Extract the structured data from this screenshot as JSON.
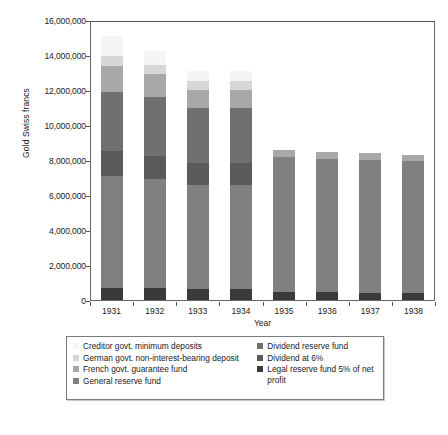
{
  "chart_data": {
    "type": "bar",
    "subtype": "stacked-bar",
    "title": "",
    "xlabel": "Year",
    "ylabel": "Gold Swiss francs",
    "categories": [
      "1931",
      "1932",
      "1933",
      "1934",
      "1935",
      "1936",
      "1937",
      "1938"
    ],
    "ylim": [
      0,
      16000000
    ],
    "ytick_values": [
      0,
      2000000,
      4000000,
      6000000,
      8000000,
      10000000,
      12000000,
      14000000,
      16000000
    ],
    "ytick_labels": [
      "0",
      "2,000,000",
      "4,000,000",
      "6,000,000",
      "8,000,000",
      "10,000,000",
      "12,000,000",
      "14,000,000",
      "16,000,000"
    ],
    "grid": false,
    "legend_position": "below",
    "legend_columns": 2,
    "series": [
      {
        "name": "Legal reserve fund 5% of net profit",
        "color": "#3a3a3a",
        "legend_column": "right",
        "values": [
          700000,
          700000,
          650000,
          650000,
          450000,
          430000,
          420000,
          420000
        ]
      },
      {
        "name": "General reserve fund",
        "color": "#808080",
        "legend_column": "left",
        "values": [
          6400000,
          6200000,
          5900000,
          5900000,
          7700000,
          7650000,
          7600000,
          7500000
        ]
      },
      {
        "name": "Dividend at 6%",
        "color": "#5a5a5a",
        "legend_column": "right",
        "values": [
          1400000,
          1350000,
          1300000,
          1300000,
          0,
          0,
          0,
          0
        ]
      },
      {
        "name": "Dividend reserve fund",
        "color": "#707070",
        "legend_column": "right",
        "values": [
          3400000,
          3350000,
          3150000,
          3150000,
          0,
          0,
          0,
          0
        ]
      },
      {
        "name": "French govt. guarantee fund",
        "color": "#a8a8a8",
        "legend_column": "left",
        "values": [
          1450000,
          1300000,
          1000000,
          1000000,
          450000,
          400000,
          380000,
          380000
        ]
      },
      {
        "name": "German govt. non-interest-bearing deposit",
        "color": "#d6d6d6",
        "legend_column": "left",
        "values": [
          600000,
          550000,
          500000,
          500000,
          0,
          0,
          0,
          0
        ]
      },
      {
        "name": "Creditor govt. minimum deposits",
        "color": "#f5f5f5",
        "legend_column": "left",
        "values": [
          1150000,
          800000,
          600000,
          600000,
          0,
          0,
          0,
          0
        ]
      }
    ],
    "totals": [
      15100000,
      14250000,
      13100000,
      13100000,
      8600000,
      8480000,
      8400000,
      8300000
    ]
  },
  "legend": {
    "left_items": [
      {
        "label": "Creditor govt. minimum deposits",
        "color": "#f5f5f5"
      },
      {
        "label": "German govt. non-interest-bearing deposit",
        "color": "#d6d6d6"
      },
      {
        "label": "French govt. guarantee fund",
        "color": "#a8a8a8"
      },
      {
        "label": "General reserve fund",
        "color": "#808080"
      }
    ],
    "right_items": [
      {
        "label": "Dividend reserve fund",
        "color": "#707070"
      },
      {
        "label": "Dividend at 6%",
        "color": "#5a5a5a"
      },
      {
        "label": "Legal reserve fund 5% of net profit",
        "color": "#3a3a3a"
      }
    ]
  }
}
